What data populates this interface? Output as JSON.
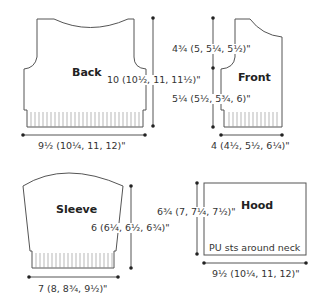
{
  "pieces": {
    "back": {
      "title": "Back",
      "height": "10 (10½, 11, 11½)\"",
      "width": "9½ (10¼, 11, 12)\""
    },
    "front": {
      "title": "Front",
      "upper_height": "4¾ (5, 5¼, 5½)\"",
      "lower_height": "5¼ (5½, 5¾, 6)\"",
      "width": "4 (4½, 5½, 6¼)\""
    },
    "sleeve": {
      "title": "Sleeve",
      "height": "6 (6¼, 6½, 6¾)\"",
      "width": "7 (8, 8¾, 9½)\""
    },
    "hood": {
      "title": "Hood",
      "height": "6¾ (7, 7¼, 7½)\"",
      "width": "9½ (10¼, 11, 12)\"",
      "note": "PU sts around neck"
    }
  },
  "colors": {
    "line": "#555555",
    "text": "#333333"
  }
}
